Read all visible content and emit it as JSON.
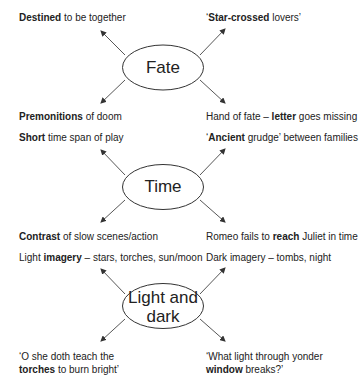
{
  "diagram": {
    "type": "mind-map",
    "groups": [
      {
        "center": "Fate",
        "branches": [
          {
            "position": "top-left",
            "bold": "Destined",
            "rest": " to be together",
            "prefix": ""
          },
          {
            "position": "top-right",
            "prefix": "‘",
            "bold": "Star-crossed",
            "rest": " lovers’"
          },
          {
            "position": "bottom-left",
            "prefix": "",
            "bold": "Premonitions",
            "rest": " of doom"
          },
          {
            "position": "bottom-right",
            "prefix": "Hand of fate – ",
            "bold": "letter",
            "rest": " goes missing"
          }
        ]
      },
      {
        "center": "Time",
        "branches": [
          {
            "position": "top-left",
            "prefix": "",
            "bold": "Short",
            "rest": " time span of play"
          },
          {
            "position": "top-right",
            "prefix": "‘",
            "bold": "Ancient",
            "rest": " grudge’ between families"
          },
          {
            "position": "bottom-left",
            "prefix": "",
            "bold": "Contrast",
            "rest": " of slow scenes/action"
          },
          {
            "position": "bottom-right",
            "prefix": "Romeo fails to ",
            "bold": "reach",
            "rest": " Juliet in time"
          }
        ]
      },
      {
        "center_line1": "Light and",
        "center_line2": "dark",
        "branches": [
          {
            "position": "top-left",
            "prefix": "Light ",
            "bold": "imagery",
            "rest": " – stars, torches, sun/moon"
          },
          {
            "position": "top-right",
            "prefix": "Dark imagery – tombs, night",
            "bold": "",
            "rest": ""
          },
          {
            "position": "bottom-left",
            "line1": "‘O she doth teach the",
            "bold": "torches",
            "rest": " to burn bright’"
          },
          {
            "position": "bottom-right",
            "line1": "‘What light through yonder",
            "bold": "window",
            "rest": " breaks?’"
          }
        ]
      }
    ]
  }
}
